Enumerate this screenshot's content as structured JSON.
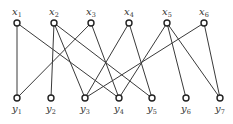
{
  "diagram": {
    "type": "bipartite-graph",
    "colors": {
      "edge": "#3a3a3a",
      "node_stroke": "#222222",
      "node_fill": "#ffffff",
      "label": "#333333"
    },
    "top_nodes": [
      {
        "id": "x1",
        "var": "x",
        "sub": "1",
        "cx": 17,
        "cy": 23
      },
      {
        "id": "x2",
        "var": "x",
        "sub": "2",
        "cx": 54,
        "cy": 23
      },
      {
        "id": "x3",
        "var": "x",
        "sub": "3",
        "cx": 91,
        "cy": 23
      },
      {
        "id": "x4",
        "var": "x",
        "sub": "4",
        "cx": 129,
        "cy": 23
      },
      {
        "id": "x5",
        "var": "x",
        "sub": "5",
        "cx": 167,
        "cy": 23
      },
      {
        "id": "x6",
        "var": "x",
        "sub": "6",
        "cx": 204,
        "cy": 23
      }
    ],
    "bottom_nodes": [
      {
        "id": "y1",
        "var": "y",
        "sub": "1",
        "cx": 17,
        "cy": 98
      },
      {
        "id": "y2",
        "var": "y",
        "sub": "2",
        "cx": 51,
        "cy": 98
      },
      {
        "id": "y3",
        "var": "y",
        "sub": "3",
        "cx": 85,
        "cy": 98
      },
      {
        "id": "y4",
        "var": "y",
        "sub": "4",
        "cx": 119,
        "cy": 98
      },
      {
        "id": "y5",
        "var": "y",
        "sub": "5",
        "cx": 152,
        "cy": 98
      },
      {
        "id": "y6",
        "var": "y",
        "sub": "6",
        "cx": 186,
        "cy": 98
      },
      {
        "id": "y7",
        "var": "y",
        "sub": "7",
        "cx": 220,
        "cy": 98
      }
    ],
    "edges": [
      [
        "x1",
        "y1"
      ],
      [
        "x1",
        "y4"
      ],
      [
        "x2",
        "y2"
      ],
      [
        "x2",
        "y5"
      ],
      [
        "x2",
        "y3"
      ],
      [
        "x3",
        "y1"
      ],
      [
        "x3",
        "y4"
      ],
      [
        "x4",
        "y3"
      ],
      [
        "x4",
        "y5"
      ],
      [
        "x5",
        "y4"
      ],
      [
        "x5",
        "y6"
      ],
      [
        "x5",
        "y7"
      ],
      [
        "x6",
        "y3"
      ],
      [
        "x6",
        "y7"
      ]
    ]
  }
}
